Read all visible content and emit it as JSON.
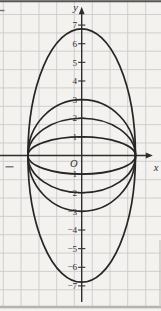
{
  "canvas": {
    "paper_color": "#f4f2ef",
    "grid_color": "#c8c9ce",
    "axis_color": "#2e2e2e",
    "curve_color": "#262626",
    "label_color": "#2e2e2e"
  },
  "layout": {
    "origin": [
      81.7,
      155.5
    ],
    "unit": [
      17.93,
      18.63
    ],
    "grid_x": [
      3.3,
      21.0,
      39.0,
      56.7,
      74.3,
      92.3,
      110.0,
      127.7,
      145.7
    ],
    "grid_y": [
      14.5,
      32.9,
      51.2,
      69.6,
      87.9,
      106.3,
      124.6,
      143.0,
      161.3,
      179.7,
      198.0,
      216.4,
      234.7,
      253.1,
      271.4,
      289.8,
      308.1
    ]
  },
  "chart_data": {
    "type": "line",
    "title": "",
    "grid": true,
    "xlim_visible": [
      -4.6,
      4.4
    ],
    "ylim_visible": [
      -8.3,
      8.3
    ],
    "x_axis": {
      "label": "x",
      "tick_labels_shown": []
    },
    "y_axis": {
      "label": "y",
      "tick_labels_shown": [
        7,
        6,
        5,
        4,
        3,
        2,
        1,
        -1,
        -2,
        -3,
        -4,
        -5,
        -6,
        -7
      ]
    },
    "origin_label": "O",
    "curves": [
      {
        "shape": "ellipse",
        "center": [
          0,
          0
        ],
        "semi_axis_x": 3,
        "semi_axis_y": 1
      },
      {
        "shape": "ellipse",
        "center": [
          0,
          0
        ],
        "semi_axis_x": 3,
        "semi_axis_y": 2
      },
      {
        "shape": "ellipse",
        "center": [
          0,
          0
        ],
        "semi_axis_x": 3,
        "semi_axis_y": 3
      },
      {
        "shape": "ellipse",
        "center": [
          0,
          0
        ],
        "semi_axis_x": 3,
        "semi_axis_y": 6.8
      }
    ],
    "shared_x_intercepts": [
      -3,
      3
    ]
  }
}
